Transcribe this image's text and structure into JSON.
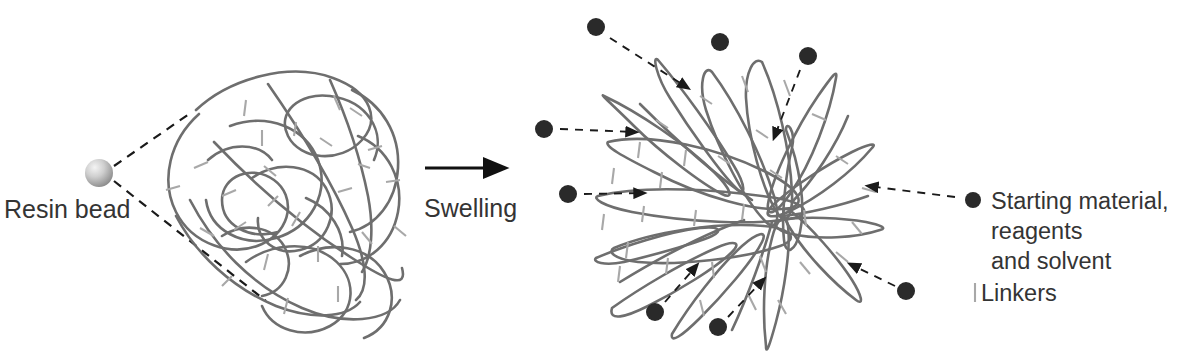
{
  "figure": {
    "background_color": "#ffffff",
    "width": 1180,
    "height": 354
  },
  "labels": {
    "resin_bead": "Resin bead",
    "swelling": "Swelling"
  },
  "legend": {
    "items": [
      {
        "marker": "filled-circle",
        "marker_color": "#2a2a2a",
        "lines": [
          "Starting material,",
          "reagents",
          "and solvent"
        ]
      },
      {
        "marker": "vertical-tick",
        "marker_color": "#a8a8a8",
        "lines": [
          "Linkers"
        ]
      }
    ]
  },
  "colors": {
    "polymer_chain": "#6e6e6e",
    "linker_tick": "#a8a8a8",
    "particle": "#2a2a2a",
    "text": "#343434",
    "dashed_guide": "#1a1a1a",
    "bead_light": "#f2f2f2",
    "bead_mid": "#c4c4c4",
    "bead_dark": "#8d8d8d"
  },
  "elements": {
    "resin_bead_sphere": {
      "cx": 99,
      "cy": 173,
      "r": 14
    },
    "magnifier_lines": [
      {
        "x1": 114,
        "y1": 166,
        "x2": 192,
        "y2": 112
      },
      {
        "x1": 114,
        "y1": 181,
        "x2": 266,
        "y2": 301
      }
    ],
    "process_arrow": {
      "x1": 425,
      "y1": 168,
      "x2": 515,
      "y2": 168
    },
    "particles": [
      {
        "cx": 596,
        "cy": 27,
        "r": 9
      },
      {
        "cx": 720,
        "cy": 42,
        "r": 9
      },
      {
        "cx": 808,
        "cy": 56,
        "r": 9
      },
      {
        "cx": 544,
        "cy": 129,
        "r": 9
      },
      {
        "cx": 568,
        "cy": 194,
        "r": 9
      },
      {
        "cx": 655,
        "cy": 312,
        "r": 9
      },
      {
        "cx": 718,
        "cy": 327,
        "r": 9
      },
      {
        "cx": 906,
        "cy": 291,
        "r": 9
      },
      {
        "cx": 973,
        "cy": 200,
        "r": 8
      }
    ],
    "particle_arrows": [
      {
        "x1": 610,
        "y1": 38,
        "x2": 690,
        "y2": 90
      },
      {
        "x1": 800,
        "y1": 70,
        "x2": 772,
        "y2": 140
      },
      {
        "x1": 560,
        "y1": 129,
        "x2": 638,
        "y2": 132
      },
      {
        "x1": 584,
        "y1": 194,
        "x2": 646,
        "y2": 193
      },
      {
        "x1": 665,
        "y1": 302,
        "x2": 695,
        "y2": 263
      },
      {
        "x1": 728,
        "y1": 317,
        "x2": 762,
        "y2": 277
      },
      {
        "x1": 895,
        "y1": 286,
        "x2": 848,
        "y2": 263
      },
      {
        "x1": 955,
        "y1": 197,
        "x2": 866,
        "y2": 186
      }
    ]
  }
}
